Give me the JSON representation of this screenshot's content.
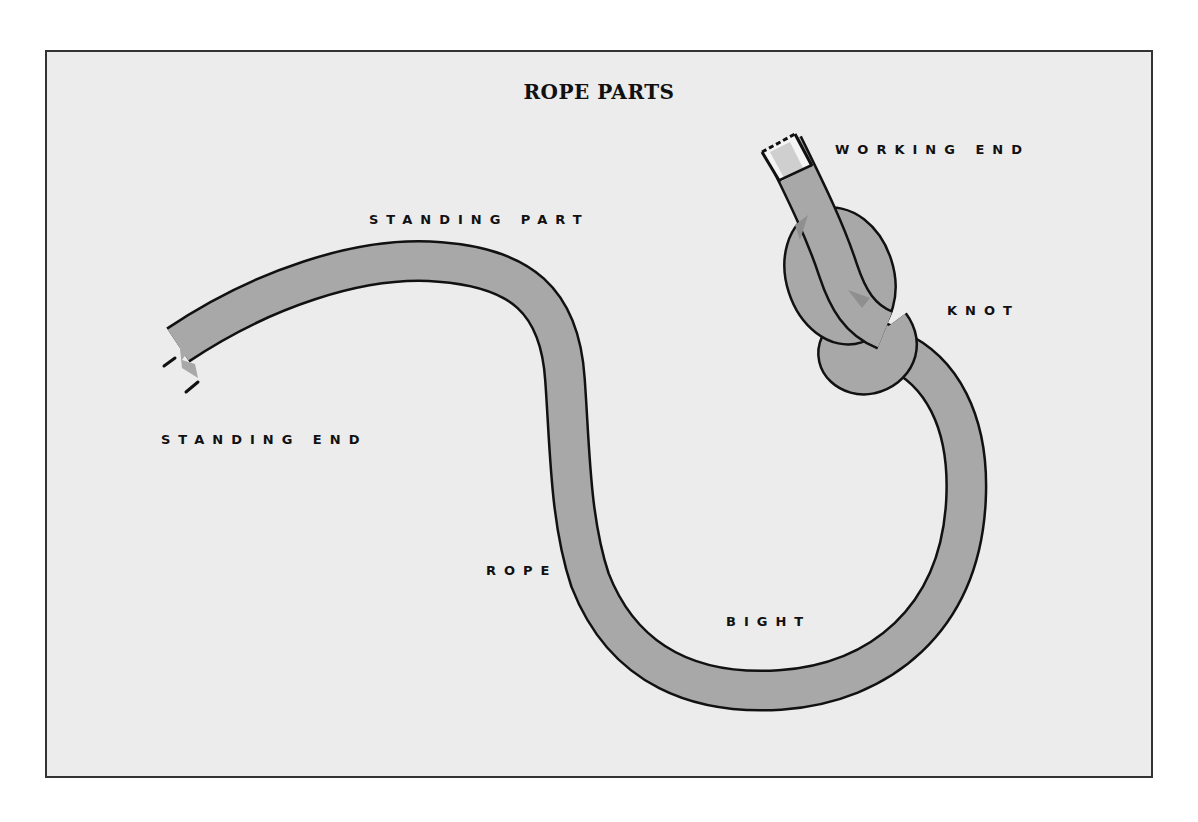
{
  "title": "ROPE PARTS",
  "labels": {
    "working_end": "WORKING END",
    "standing_part": "STANDING PART",
    "knot": "KNOT",
    "standing_end": "STANDING END",
    "rope": "ROPE",
    "bight": "BIGHT"
  },
  "colors": {
    "background": "#ececec",
    "rope_fill": "#a8a8a8",
    "rope_outline": "#111111",
    "rope_shadow": "#8f8f8f",
    "working_end_cap": "#f4f4f4",
    "working_end_stripe": "#cfcfcf"
  }
}
